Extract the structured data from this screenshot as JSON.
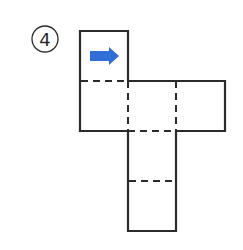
{
  "problem": {
    "number_label": "4",
    "number_style": "circled"
  },
  "net": {
    "type": "cube-net",
    "faces": [
      {
        "id": "top",
        "col": 0,
        "row": 0,
        "has_arrow": true,
        "arrow_direction": "right"
      },
      {
        "id": "left",
        "col": 0,
        "row": 1
      },
      {
        "id": "center",
        "col": 1,
        "row": 1
      },
      {
        "id": "right",
        "col": 2,
        "row": 1
      },
      {
        "id": "below",
        "col": 1,
        "row": 2
      },
      {
        "id": "bottom",
        "col": 1,
        "row": 3
      }
    ],
    "fold_lines": "dashed",
    "cut_lines": "solid"
  },
  "colors": {
    "outline": "#2b2b2b",
    "arrow": "#2f6fd6",
    "background": "#ffffff"
  }
}
